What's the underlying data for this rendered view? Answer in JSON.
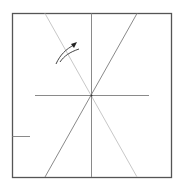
{
  "diagram": {
    "type": "origami-crease-pattern",
    "colors": {
      "paper_border": "#555555",
      "crease": "#8a8a8a",
      "light_crease": "#c8c8c8",
      "arrow": "#333333",
      "background": "#ffffff"
    },
    "square": {
      "x1": 12,
      "y1": 13,
      "x2": 171,
      "y2": 177
    },
    "lines": [
      {
        "name": "vertical-center-crease",
        "x1": 91,
        "y1": 13,
        "x2": 91,
        "y2": 177,
        "style": "crease"
      },
      {
        "name": "horizontal-crease",
        "x1": 35,
        "y1": 95,
        "x2": 149,
        "y2": 95,
        "style": "crease"
      },
      {
        "name": "diagonal-crease-light",
        "x1": 45,
        "y1": 13,
        "x2": 137,
        "y2": 177,
        "style": "light_crease"
      },
      {
        "name": "diagonal-crease-dark",
        "x1": 137,
        "y1": 13,
        "x2": 45,
        "y2": 177,
        "style": "crease"
      },
      {
        "name": "left-edge-mark",
        "x1": 12,
        "y1": 136,
        "x2": 30,
        "y2": 136,
        "style": "crease"
      }
    ],
    "arrow": {
      "name": "fold-direction-arrow"
    }
  }
}
